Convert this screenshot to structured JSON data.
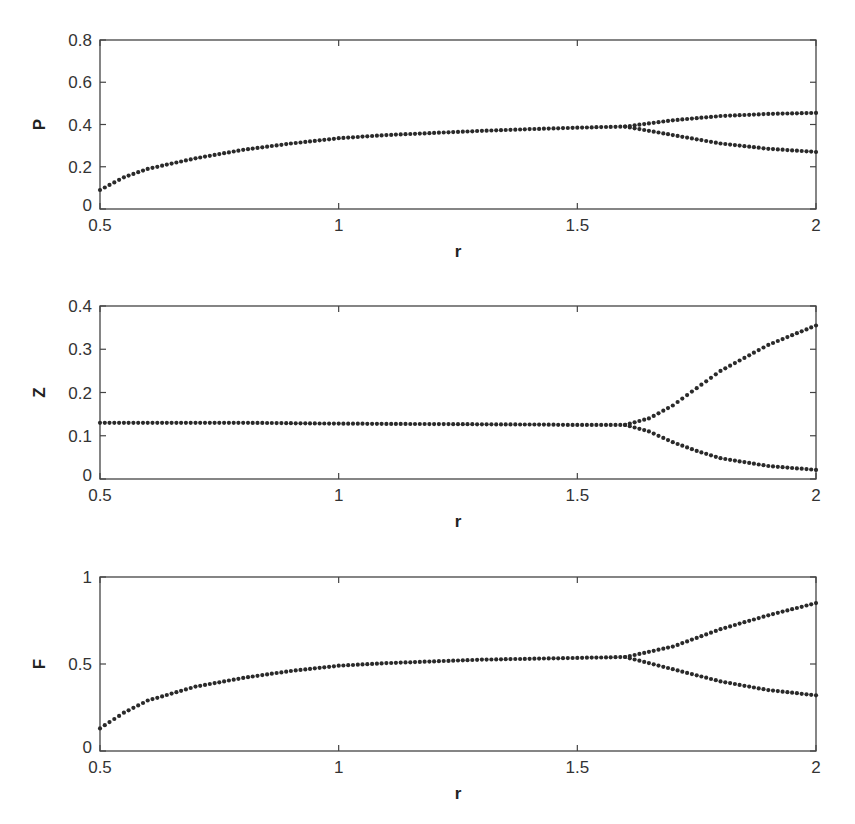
{
  "chart_data": [
    {
      "type": "scatter",
      "title": "",
      "xlabel": "r",
      "ylabel": "P",
      "xlim": [
        0.5,
        2
      ],
      "ylim": [
        0,
        0.8
      ],
      "xticks": [
        "0.5",
        "1",
        "1.5",
        "2"
      ],
      "yticks": [
        "0",
        "0.2",
        "0.4",
        "0.6",
        "0.8"
      ],
      "grid": false,
      "bifurcation_r": 1.6,
      "series": [
        {
          "name": "upper branch",
          "x": [
            0.5,
            0.55,
            0.6,
            0.7,
            0.8,
            0.9,
            1.0,
            1.1,
            1.2,
            1.3,
            1.4,
            1.5,
            1.6,
            1.7,
            1.8,
            1.9,
            2.0
          ],
          "y": [
            0.09,
            0.15,
            0.19,
            0.24,
            0.28,
            0.31,
            0.335,
            0.35,
            0.36,
            0.37,
            0.378,
            0.385,
            0.39,
            0.42,
            0.44,
            0.45,
            0.455
          ]
        },
        {
          "name": "lower branch",
          "x": [
            1.6,
            1.7,
            1.8,
            1.9,
            2.0
          ],
          "y": [
            0.39,
            0.35,
            0.31,
            0.285,
            0.27
          ]
        }
      ]
    },
    {
      "type": "scatter",
      "title": "",
      "xlabel": "r",
      "ylabel": "Z",
      "xlim": [
        0.5,
        2
      ],
      "ylim": [
        0,
        0.4
      ],
      "xticks": [
        "0.5",
        "1",
        "1.5",
        "2"
      ],
      "yticks": [
        "0",
        "0.1",
        "0.2",
        "0.3",
        "0.4"
      ],
      "grid": false,
      "bifurcation_r": 1.6,
      "series": [
        {
          "name": "upper branch",
          "x": [
            0.5,
            0.8,
            1.0,
            1.2,
            1.4,
            1.5,
            1.6,
            1.65,
            1.7,
            1.75,
            1.8,
            1.9,
            2.0
          ],
          "y": [
            0.13,
            0.13,
            0.128,
            0.127,
            0.126,
            0.125,
            0.125,
            0.14,
            0.17,
            0.21,
            0.25,
            0.31,
            0.355
          ]
        },
        {
          "name": "lower branch",
          "x": [
            1.6,
            1.65,
            1.7,
            1.75,
            1.8,
            1.9,
            2.0
          ],
          "y": [
            0.125,
            0.11,
            0.085,
            0.065,
            0.048,
            0.03,
            0.021
          ]
        }
      ]
    },
    {
      "type": "scatter",
      "title": "",
      "xlabel": "r",
      "ylabel": "F",
      "xlim": [
        0.5,
        2
      ],
      "ylim": [
        0,
        1
      ],
      "xticks": [
        "0.5",
        "1",
        "1.5",
        "2"
      ],
      "yticks": [
        "0",
        "0.5",
        "1"
      ],
      "grid": false,
      "bifurcation_r": 1.6,
      "series": [
        {
          "name": "upper branch",
          "x": [
            0.5,
            0.55,
            0.6,
            0.7,
            0.8,
            0.9,
            1.0,
            1.1,
            1.2,
            1.3,
            1.4,
            1.5,
            1.6,
            1.7,
            1.8,
            1.9,
            2.0
          ],
          "y": [
            0.13,
            0.22,
            0.29,
            0.37,
            0.42,
            0.46,
            0.49,
            0.505,
            0.515,
            0.525,
            0.53,
            0.535,
            0.54,
            0.6,
            0.7,
            0.78,
            0.85
          ]
        },
        {
          "name": "lower branch",
          "x": [
            1.6,
            1.7,
            1.8,
            1.9,
            2.0
          ],
          "y": [
            0.54,
            0.47,
            0.4,
            0.35,
            0.32
          ]
        }
      ]
    }
  ],
  "panels": [
    {
      "ylabel": "P",
      "xlabel": "r"
    },
    {
      "ylabel": "Z",
      "xlabel": "r"
    },
    {
      "ylabel": "F",
      "xlabel": "r"
    }
  ],
  "style": {
    "dot_color": "#2a2a2a",
    "axis_color": "#444444"
  }
}
